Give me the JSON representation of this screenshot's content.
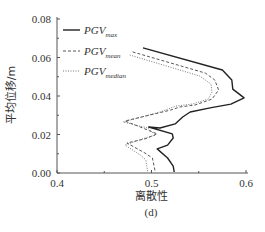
{
  "chart_data": {
    "type": "line",
    "title": "",
    "caption": "(d)",
    "xlabel": "离散性",
    "ylabel": "平均位移/m",
    "xlim": [
      0.4,
      0.6
    ],
    "ylim": [
      0.0,
      0.08
    ],
    "xticks": [
      "0.4",
      "0.5",
      "0.6"
    ],
    "yticks": [
      "0.00",
      "0.02",
      "0.04",
      "0.06",
      "0.08"
    ],
    "grid": false,
    "legend_position": "upper left",
    "orientation": "x is dispersion (离散性), y is mean displacement; curves are plotted as x vs height",
    "series": [
      {
        "name": "PGV_max",
        "legend_main": "PGV",
        "legend_sub": "max",
        "style": "solid",
        "color": "#222222",
        "points": [
          [
            0.491,
            0.065
          ],
          [
            0.575,
            0.0535
          ],
          [
            0.585,
            0.0483
          ],
          [
            0.586,
            0.0436
          ],
          [
            0.598,
            0.039
          ],
          [
            0.584,
            0.0358
          ],
          [
            0.562,
            0.0338
          ],
          [
            0.541,
            0.0317
          ],
          [
            0.533,
            0.0291
          ],
          [
            0.525,
            0.0255
          ],
          [
            0.509,
            0.0234
          ],
          [
            0.497,
            0.0239
          ],
          [
            0.522,
            0.0203
          ],
          [
            0.523,
            0.0182
          ],
          [
            0.517,
            0.0145
          ],
          [
            0.506,
            0.0125
          ],
          [
            0.517,
            0.0078
          ],
          [
            0.523,
            0.0036
          ],
          [
            0.524,
            0.0005
          ]
        ]
      },
      {
        "name": "PGV_mean",
        "legend_main": "PGV",
        "legend_sub": "mean",
        "style": "dashed",
        "color": "#444444",
        "points": [
          [
            0.48,
            0.0629
          ],
          [
            0.557,
            0.0519
          ],
          [
            0.567,
            0.0483
          ],
          [
            0.571,
            0.0431
          ],
          [
            0.564,
            0.0384
          ],
          [
            0.546,
            0.0353
          ],
          [
            0.53,
            0.0343
          ],
          [
            0.52,
            0.0327
          ],
          [
            0.498,
            0.0301
          ],
          [
            0.472,
            0.027
          ],
          [
            0.488,
            0.0239
          ],
          [
            0.506,
            0.0203
          ],
          [
            0.493,
            0.0177
          ],
          [
            0.474,
            0.0156
          ],
          [
            0.493,
            0.0104
          ],
          [
            0.501,
            0.0078
          ],
          [
            0.504,
            0.0005
          ]
        ]
      },
      {
        "name": "PGV_median",
        "legend_main": "PGV",
        "legend_sub": "median",
        "style": "dotted",
        "color": "#666666",
        "points": [
          [
            0.477,
            0.0613
          ],
          [
            0.551,
            0.0504
          ],
          [
            0.563,
            0.0462
          ],
          [
            0.564,
            0.0421
          ],
          [
            0.56,
            0.0384
          ],
          [
            0.543,
            0.0358
          ],
          [
            0.526,
            0.0348
          ],
          [
            0.509,
            0.0317
          ],
          [
            0.47,
            0.0265
          ],
          [
            0.496,
            0.0234
          ],
          [
            0.504,
            0.0197
          ],
          [
            0.49,
            0.0177
          ],
          [
            0.472,
            0.0145
          ],
          [
            0.488,
            0.0094
          ],
          [
            0.494,
            0.0068
          ],
          [
            0.496,
            0.0005
          ]
        ]
      }
    ]
  }
}
